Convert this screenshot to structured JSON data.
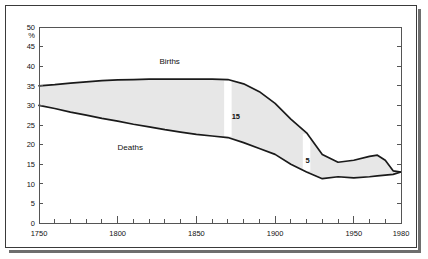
{
  "chart_data": {
    "type": "area",
    "title": "",
    "xlabel": "",
    "ylabel": "%",
    "xlim": [
      1750,
      1980
    ],
    "ylim": [
      0,
      50
    ],
    "grid": false,
    "legend_position": "inline-annotation",
    "y_ticks": [
      0,
      5,
      10,
      15,
      20,
      25,
      30,
      35,
      40,
      45,
      50
    ],
    "y_tick_labels": [
      "0",
      "5",
      "10",
      "15",
      "20",
      "25",
      "30",
      "35",
      "40",
      "45",
      "50"
    ],
    "x_ticks": [
      1750,
      1800,
      1850,
      1900,
      1950,
      1980
    ],
    "x_tick_labels": [
      "1750",
      "1800",
      "1850",
      "1900",
      "1950",
      "1980"
    ],
    "x_minor_step": 10,
    "x": [
      1750,
      1760,
      1770,
      1780,
      1790,
      1800,
      1810,
      1820,
      1830,
      1840,
      1850,
      1860,
      1870,
      1880,
      1890,
      1900,
      1910,
      1920,
      1930,
      1940,
      1950,
      1960,
      1965,
      1970,
      1975,
      1980
    ],
    "series": [
      {
        "name": "Births",
        "label": "Births",
        "values": [
          35.0,
          35.3,
          35.7,
          36.0,
          36.3,
          36.5,
          36.6,
          36.7,
          36.7,
          36.7,
          36.7,
          36.7,
          36.6,
          35.5,
          33.5,
          30.5,
          26.5,
          23.0,
          17.5,
          15.5,
          16.0,
          17.0,
          17.3,
          16.0,
          13.3,
          13.0
        ]
      },
      {
        "name": "Deaths",
        "label": "Deaths",
        "values": [
          30.0,
          29.2,
          28.3,
          27.5,
          26.7,
          26.0,
          25.2,
          24.5,
          23.8,
          23.2,
          22.6,
          22.2,
          21.8,
          20.5,
          19.0,
          17.5,
          15.0,
          13.0,
          11.3,
          11.8,
          11.5,
          11.8,
          12.0,
          12.2,
          12.4,
          13.0
        ]
      }
    ],
    "annotations": [
      {
        "label": "15",
        "x": 1870,
        "type": "gap-marker",
        "gap_value": 15
      },
      {
        "label": "5",
        "x": 1920,
        "type": "gap-marker",
        "gap_value": 5
      }
    ],
    "band_color": "#e7e7e7",
    "line_color": "#1a1a1a"
  },
  "labels": {
    "births": "Births",
    "deaths": "Deaths",
    "percent": "%",
    "gap_15": "15",
    "gap_5": "5"
  }
}
